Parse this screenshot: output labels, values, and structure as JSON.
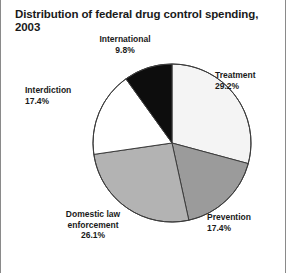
{
  "chart_data": {
    "type": "pie",
    "title": "Distribution of federal drug control spending, 2003",
    "xlabel": "",
    "ylabel": "",
    "legend_position": "none",
    "grid": false,
    "start_angle_deg": 0,
    "direction": "clockwise",
    "categories": [
      "Treatment",
      "Prevention",
      "Domestic law enforcement",
      "Interdiction",
      "International"
    ],
    "values": [
      29.2,
      17.4,
      26.1,
      17.4,
      9.8
    ],
    "units": "percent",
    "slices": [
      {
        "label": "Treatment",
        "value": 29.2,
        "value_text": "29.2%",
        "color": "#f4f4f4",
        "start_deg": 0.0,
        "end_deg": 105.1
      },
      {
        "label": "Prevention",
        "value": 17.4,
        "value_text": "17.4%",
        "color": "#9b9b9b",
        "start_deg": 105.1,
        "end_deg": 167.7
      },
      {
        "label": "Domestic law enforcement",
        "value": 26.1,
        "value_text": "26.1%",
        "color": "#b3b3b3",
        "start_deg": 167.7,
        "end_deg": 261.7
      },
      {
        "label": "Interdiction",
        "value": 17.4,
        "value_text": "17.4%",
        "color": "#ffffff",
        "start_deg": 261.7,
        "end_deg": 324.3
      },
      {
        "label": "International",
        "value": 9.8,
        "value_text": "9.8%",
        "color": "#0d0d0d",
        "start_deg": 324.3,
        "end_deg": 360.0
      }
    ]
  },
  "labels": {
    "international": {
      "name": "International",
      "pct": "9.8%"
    },
    "treatment": {
      "name": "Treatment",
      "pct": "29.2%"
    },
    "interdiction": {
      "name": "Interdiction",
      "pct": "17.4%"
    },
    "prevention": {
      "name": "Prevention",
      "pct": "17.4%"
    },
    "domestic_line1": "Domestic law",
    "domestic_line2": "enforcement",
    "domestic_pct": "26.1%"
  },
  "colors": {
    "frame_border": "#8a8a8a",
    "outline": "#3c3c3c",
    "text": "#1a1a1a",
    "background": "#ffffff"
  }
}
